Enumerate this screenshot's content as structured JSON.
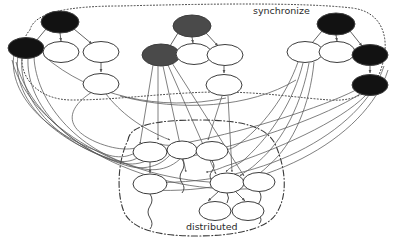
{
  "figure": {
    "width": 394,
    "height": 245,
    "background": "#ffffff",
    "style": "scanned low-resolution grayscale graph drawing",
    "edge_color": "#555555",
    "outline_color": "#333333"
  },
  "clusters": [
    {
      "id": "synchronize",
      "label": "synchronize",
      "label_x": 253,
      "label_y": 14,
      "label_size": 9.5,
      "border_style": "dotted",
      "border_color": "#3a3a3a"
    },
    {
      "id": "distributed",
      "label": "distributed",
      "label_x": 186,
      "label_y": 230,
      "label_size": 9.5,
      "border_style": "dash-dot",
      "border_color": "#3a3a3a"
    }
  ],
  "palette": {
    "black_node": "#121212",
    "gray_node": "#4a4a4a",
    "white_node": "#ffffff",
    "node_stroke": "#3d3d3d",
    "edge": "#555555",
    "label_text": "#2b2b2b"
  },
  "nodes": [
    {
      "id": "L1",
      "cx": 60,
      "cy": 22,
      "rx": 19,
      "ry": 11,
      "fill": "black_node",
      "cluster": "synchronize"
    },
    {
      "id": "L2",
      "cx": 26,
      "cy": 48,
      "rx": 18,
      "ry": 10.5,
      "fill": "black_node",
      "cluster": "synchronize"
    },
    {
      "id": "L3",
      "cx": 61,
      "cy": 52,
      "rx": 18,
      "ry": 10.5,
      "fill": "white_node",
      "cluster": "synchronize"
    },
    {
      "id": "L4",
      "cx": 101,
      "cy": 52,
      "rx": 18,
      "ry": 10.5,
      "fill": "white_node",
      "cluster": "synchronize"
    },
    {
      "id": "L5",
      "cx": 101,
      "cy": 84,
      "rx": 18,
      "ry": 10.5,
      "fill": "white_node",
      "cluster": "synchronize"
    },
    {
      "id": "M1",
      "cx": 192,
      "cy": 26,
      "rx": 19,
      "ry": 11,
      "fill": "gray_node",
      "cluster": "synchronize"
    },
    {
      "id": "M2",
      "cx": 161,
      "cy": 55,
      "rx": 19,
      "ry": 11,
      "fill": "gray_node",
      "cluster": "synchronize"
    },
    {
      "id": "M3",
      "cx": 194,
      "cy": 54,
      "rx": 18,
      "ry": 10.5,
      "fill": "white_node",
      "cluster": "synchronize"
    },
    {
      "id": "M4",
      "cx": 225,
      "cy": 55,
      "rx": 18,
      "ry": 10.5,
      "fill": "white_node",
      "cluster": "synchronize"
    },
    {
      "id": "M5",
      "cx": 224,
      "cy": 85,
      "rx": 18,
      "ry": 10.5,
      "fill": "white_node",
      "cluster": "synchronize"
    },
    {
      "id": "R1",
      "cx": 336,
      "cy": 24,
      "rx": 19,
      "ry": 11,
      "fill": "black_node",
      "cluster": "synchronize"
    },
    {
      "id": "R2",
      "cx": 305,
      "cy": 52,
      "rx": 18,
      "ry": 10.5,
      "fill": "white_node",
      "cluster": "synchronize"
    },
    {
      "id": "R3",
      "cx": 337,
      "cy": 52,
      "rx": 18,
      "ry": 10.5,
      "fill": "white_node",
      "cluster": "synchronize"
    },
    {
      "id": "R4",
      "cx": 370,
      "cy": 55,
      "rx": 18,
      "ry": 10.5,
      "fill": "black_node",
      "cluster": "synchronize"
    },
    {
      "id": "R5",
      "cx": 370,
      "cy": 85,
      "rx": 18,
      "ry": 10.5,
      "fill": "black_node",
      "cluster": "synchronize"
    },
    {
      "id": "D1",
      "cx": 150,
      "cy": 152,
      "rx": 17,
      "ry": 10,
      "fill": "white_node",
      "cluster": "distributed"
    },
    {
      "id": "D2",
      "cx": 182,
      "cy": 150,
      "rx": 15,
      "ry": 9,
      "fill": "white_node",
      "cluster": "distributed"
    },
    {
      "id": "D3",
      "cx": 212,
      "cy": 151,
      "rx": 16,
      "ry": 9.5,
      "fill": "white_node",
      "cluster": "distributed"
    },
    {
      "id": "D4",
      "cx": 150,
      "cy": 184,
      "rx": 17,
      "ry": 10,
      "fill": "white_node",
      "cluster": "distributed"
    },
    {
      "id": "D5",
      "cx": 227,
      "cy": 183,
      "rx": 17,
      "ry": 10,
      "fill": "white_node",
      "cluster": "distributed"
    },
    {
      "id": "D6",
      "cx": 259,
      "cy": 182,
      "rx": 16,
      "ry": 9.5,
      "fill": "white_node",
      "cluster": "distributed"
    },
    {
      "id": "D7",
      "cx": 215,
      "cy": 211,
      "rx": 16,
      "ry": 9.5,
      "fill": "white_node",
      "cluster": "distributed"
    },
    {
      "id": "D8",
      "cx": 248,
      "cy": 211,
      "rx": 16,
      "ry": 9.5,
      "fill": "white_node",
      "cluster": "distributed"
    }
  ],
  "tree_edges": [
    {
      "from": "L1",
      "to": "L2"
    },
    {
      "from": "L1",
      "to": "L3"
    },
    {
      "from": "L1",
      "to": "L4"
    },
    {
      "from": "L4",
      "to": "L5"
    },
    {
      "from": "M1",
      "to": "M2"
    },
    {
      "from": "M1",
      "to": "M3"
    },
    {
      "from": "M1",
      "to": "M4"
    },
    {
      "from": "M4",
      "to": "M5"
    },
    {
      "from": "R1",
      "to": "R2"
    },
    {
      "from": "R1",
      "to": "R3"
    },
    {
      "from": "R1",
      "to": "R4"
    },
    {
      "from": "R4",
      "to": "R5"
    },
    {
      "from": "D1",
      "to": "D4"
    },
    {
      "from": "D5",
      "to": "D7"
    },
    {
      "from": "D5",
      "to": "D8"
    }
  ],
  "squiggle_count": 5,
  "long_edge_count": 22
}
